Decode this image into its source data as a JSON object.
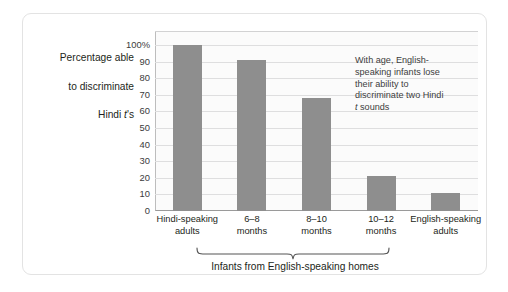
{
  "figure": {
    "y_axis_title": "Percentage able\nto discriminate\nHindi t's",
    "y_axis_title_line1": "Percentage able",
    "y_axis_title_line2": "to discriminate",
    "y_axis_title_line3_pre": "Hindi ",
    "y_axis_title_line3_italic": "t",
    "y_axis_title_line3_post": "'s",
    "annotation_line1": "With age, English-",
    "annotation_line2": "speaking infants lose",
    "annotation_line3": "their ability to",
    "annotation_line4": "discriminate two Hindi",
    "annotation_line5_italic": "t",
    "annotation_line5_post": " sounds",
    "group_caption": "Infants from English-speaking homes",
    "colors": {
      "bar": "#8e8e8e",
      "gridline": "#dededf",
      "plot_background": "#fbfbfb",
      "axis": "#9a9a9a",
      "frame_border": "#e3e3e3",
      "text": "#231f20"
    }
  },
  "chart_data": {
    "type": "bar",
    "title": "",
    "xlabel": "Infants from English-speaking homes",
    "ylabel": "Percentage able to discriminate Hindi t's",
    "ylim": [
      0,
      100
    ],
    "ytick_labels": [
      "100%",
      "90",
      "80",
      "70",
      "60",
      "50",
      "40",
      "30",
      "20",
      "10",
      "0"
    ],
    "ytick_values": [
      100,
      90,
      80,
      70,
      60,
      50,
      40,
      30,
      20,
      10,
      0
    ],
    "grid": true,
    "legend": "none",
    "categories": [
      "Hindi-speaking\nadults",
      "6–8\nmonths",
      "8–10\nmonths",
      "10–12\nmonths",
      "English-speaking\nadults"
    ],
    "category_labels": [
      {
        "line1": "Hindi-speaking",
        "line2": "adults"
      },
      {
        "line1": "6–8",
        "line2": "months"
      },
      {
        "line1": "8–10",
        "line2": "months"
      },
      {
        "line1": "10–12",
        "line2": "months"
      },
      {
        "line1": "English-speaking",
        "line2": "adults"
      }
    ],
    "values": [
      100,
      91,
      68,
      21,
      11
    ],
    "annotations": [
      "With age, English-speaking infants lose their ability to discriminate two Hindi t sounds"
    ]
  }
}
